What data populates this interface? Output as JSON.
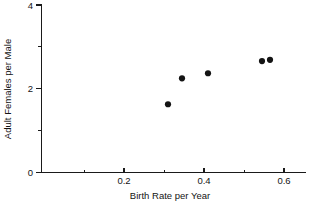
{
  "chart_data": {
    "type": "scatter",
    "title": "",
    "xlabel": "Birth Rate per Year",
    "ylabel": "Adult Females per Male",
    "xlim": [
      0.0,
      0.655
    ],
    "ylim": [
      0,
      4
    ],
    "grid": false,
    "legend": null,
    "x_major_ticks": [
      0.2,
      0.4,
      0.6
    ],
    "x_major_tick_labels": [
      "0.2",
      "0.4",
      "0.6"
    ],
    "x_minor_ticks": [
      0.1,
      0.3,
      0.5
    ],
    "y_major_ticks": [
      0,
      2,
      4
    ],
    "y_major_tick_labels": [
      "0",
      "2",
      "4"
    ],
    "y_minor_ticks": [
      1,
      3
    ],
    "series": [
      {
        "name": "observations",
        "marker": "filled-circle",
        "color": "#141414",
        "points": [
          {
            "x": 0.31,
            "y": 1.63
          },
          {
            "x": 0.345,
            "y": 2.25
          },
          {
            "x": 0.41,
            "y": 2.37
          },
          {
            "x": 0.545,
            "y": 2.66
          },
          {
            "x": 0.565,
            "y": 2.69
          }
        ]
      }
    ]
  },
  "axis_labels": {
    "x_title": "Birth Rate per Year",
    "y_title": "Adult Females per Male"
  },
  "tick_labels": {
    "x": [
      "0.2",
      "0.4",
      "0.6"
    ],
    "y": [
      "0",
      "2",
      "4"
    ]
  }
}
